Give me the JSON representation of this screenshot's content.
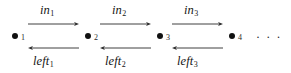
{
  "diagram": {
    "type": "labeled-transition-chain",
    "title": "",
    "background_color": "#ffffff",
    "ink_color": "#1b1b1b",
    "arrow_color": "#2b2b2b",
    "nodes": [
      {
        "id": "n1",
        "label": "1",
        "x": 15,
        "y": 36
      },
      {
        "id": "n2",
        "label": "2",
        "x": 88,
        "y": 36
      },
      {
        "id": "n3",
        "label": "3",
        "x": 160,
        "y": 36
      },
      {
        "id": "n4",
        "label": "4",
        "x": 232,
        "y": 36
      }
    ],
    "forward_edges": [
      {
        "id": "e-in-1",
        "base": "in",
        "sub": "1",
        "from": "n1",
        "to": "n2",
        "direction": "right",
        "x1": 28,
        "x2": 79,
        "y": 24,
        "label_x": 53,
        "label_y": 10
      },
      {
        "id": "e-in-2",
        "base": "in",
        "sub": "2",
        "from": "n2",
        "to": "n3",
        "direction": "right",
        "x1": 100,
        "x2": 151,
        "y": 24,
        "label_x": 125,
        "label_y": 10
      },
      {
        "id": "e-in-3",
        "base": "in",
        "sub": "3",
        "from": "n3",
        "to": "n4",
        "direction": "right",
        "x1": 172,
        "x2": 223,
        "y": 24,
        "label_x": 197,
        "label_y": 10
      }
    ],
    "backward_edges": [
      {
        "id": "e-left-1",
        "base": "left",
        "sub": "1",
        "from": "n2",
        "to": "n1",
        "direction": "left",
        "x1": 28,
        "x2": 79,
        "y": 48,
        "label_x": 53,
        "label_y": 62
      },
      {
        "id": "e-left-2",
        "base": "left",
        "sub": "2",
        "from": "n3",
        "to": "n2",
        "direction": "left",
        "x1": 100,
        "x2": 151,
        "y": 48,
        "label_x": 125,
        "label_y": 62
      },
      {
        "id": "e-left-3",
        "base": "left",
        "sub": "3",
        "from": "n4",
        "to": "n3",
        "direction": "left",
        "x1": 172,
        "x2": 223,
        "y": 48,
        "label_x": 197,
        "label_y": 62
      }
    ],
    "continuation": {
      "symbol": "· · ·",
      "x": 258,
      "y": 33
    }
  }
}
